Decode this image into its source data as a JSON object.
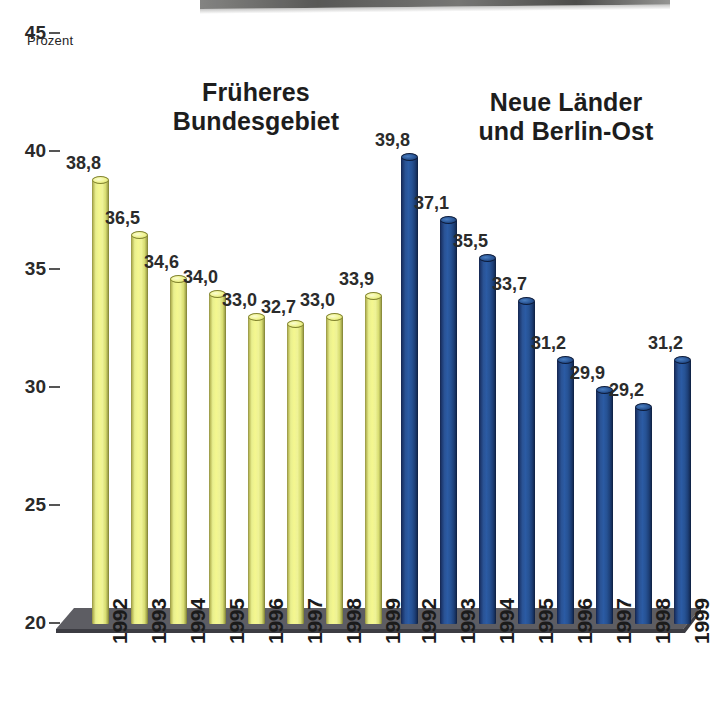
{
  "axis": {
    "unit_label": "Prozent",
    "ticks": [
      "45",
      "40",
      "35",
      "30",
      "25",
      "20"
    ],
    "ymin": 20,
    "ymax": 45
  },
  "groups": {
    "west": {
      "title_line1": "Früheres",
      "title_line2": "Bundesgebiet",
      "color": "#eff28f"
    },
    "east": {
      "title_line1": "Neue Länder",
      "title_line2": "und Berlin-Ost",
      "color": "#2a5396"
    }
  },
  "chart_data": {
    "type": "bar",
    "title": "",
    "subtitle": "",
    "xlabel": "",
    "ylabel": "Prozent",
    "ylim": [
      20,
      45
    ],
    "yticks": [
      20,
      25,
      30,
      35,
      40,
      45
    ],
    "grid": false,
    "legend_position": "none",
    "decimal_separator": ",",
    "categories": [
      "1992",
      "1993",
      "1994",
      "1995",
      "1996",
      "1997",
      "1998",
      "1999"
    ],
    "series": [
      {
        "name": "Früheres Bundesgebiet",
        "color": "#eff28f",
        "values": [
          38.8,
          36.5,
          34.6,
          34.0,
          33.0,
          32.7,
          33.0,
          33.9
        ],
        "labels": [
          "38,8",
          "36,5",
          "34,6",
          "34,0",
          "33,0",
          "32,7",
          "33,0",
          "33,9"
        ]
      },
      {
        "name": "Neue Länder und Berlin-Ost",
        "color": "#2a5396",
        "values": [
          39.8,
          37.1,
          35.5,
          33.7,
          31.2,
          29.9,
          29.2,
          31.2
        ],
        "labels": [
          "39,8",
          "37,1",
          "35,5",
          "33,7",
          "31,2",
          "29,9",
          "29,2",
          "31,2"
        ]
      }
    ]
  }
}
